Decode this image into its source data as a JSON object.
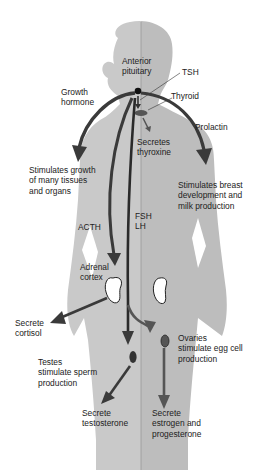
{
  "diagram": {
    "colors": {
      "background": "#ffffff",
      "body_left_male": "#c9c9c9",
      "body_right_female": "#bdbdbd",
      "midline": "#9a9a9a",
      "arrow_dark": "#3a3a3a",
      "arrow_mid": "#555555",
      "gland_dark": "#3d3d3d",
      "kidney": "#ffffff"
    },
    "labels": {
      "anterior_pituitary": "Anterior\npituitary",
      "tsh": "TSH",
      "thyroid": "Thyroid",
      "growth_hormone": "Growth\nhormone",
      "prolactin": "Prolactin",
      "secretes_thyroxine": "Secretes\nthyroxine",
      "stimulates_growth": "Stimulates growth\nof many tissues\nand organs",
      "stimulates_breast": "Stimulates breast\ndevelopment and\nmilk production",
      "fsh_lh": "FSH\nLH",
      "acth": "ACTH",
      "adrenal_cortex": "Adrenal\ncortex",
      "secrete_cortisol": "Secrete\ncortisol",
      "ovaries": "Ovaries\nstimulate egg cell\nproduction",
      "testes": "Testes\nstimulate sperm\nproduction",
      "secrete_testosterone": "Secrete\ntestosterone",
      "secrete_estrogen": "Secrete\nestrogen and\nprogesterone"
    },
    "pathways": [
      {
        "from": "Anterior pituitary",
        "hormone": "Growth hormone",
        "to": "Stimulates growth of many tissues and organs"
      },
      {
        "from": "Anterior pituitary",
        "hormone": "Prolactin",
        "to": "Stimulates breast development and milk production"
      },
      {
        "from": "Anterior pituitary",
        "hormone": "TSH",
        "to": "Thyroid",
        "effect": "Secretes thyroxine"
      },
      {
        "from": "Anterior pituitary",
        "hormone": "ACTH",
        "to": "Adrenal cortex",
        "effect": "Secrete cortisol"
      },
      {
        "from": "Anterior pituitary",
        "hormone": "FSH LH",
        "to": "Testes stimulate sperm production",
        "effect": "Secrete testosterone"
      },
      {
        "from": "Anterior pituitary",
        "hormone": "FSH LH",
        "to": "Ovaries stimulate egg cell production",
        "effect": "Secrete estrogen and progesterone"
      }
    ]
  }
}
